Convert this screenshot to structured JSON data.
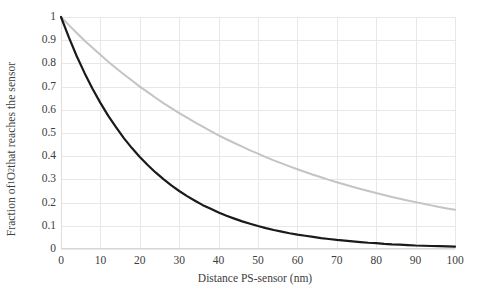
{
  "chart_data": {
    "type": "line",
    "title": "",
    "xlabel": "Distance PS-sensor (nm)",
    "ylabel_parts": {
      "pre": "Fraction of ",
      "sup": "1",
      "mid": "O",
      "sub": "2",
      "post": " that reaches the sensor"
    },
    "ylabel_plain": "Fraction of 1O2 that reaches the sensor",
    "xlim": [
      0,
      100
    ],
    "ylim": [
      0,
      1
    ],
    "xticks": [
      0,
      10,
      20,
      30,
      40,
      50,
      60,
      70,
      80,
      90,
      100
    ],
    "xtick_labels": [
      "0",
      "10",
      "20",
      "30",
      "40",
      "50",
      "60",
      "70",
      "80",
      "90",
      "100"
    ],
    "yticks": [
      0,
      0.1,
      0.2,
      0.3,
      0.4,
      0.5,
      0.6,
      0.7,
      0.8,
      0.9,
      1
    ],
    "ytick_labels": [
      "0",
      "0.1",
      "0.2",
      "0.3",
      "0.4",
      "0.5",
      "0.6",
      "0.7",
      "0.8",
      "0.9",
      "1"
    ],
    "grid": true,
    "grid_color": "#e8e8e8",
    "legend": null,
    "background": "#ffffff",
    "x": [
      0,
      2,
      4,
      6,
      8,
      10,
      12,
      14,
      16,
      18,
      20,
      22,
      24,
      26,
      28,
      30,
      32,
      34,
      36,
      38,
      40,
      42,
      44,
      46,
      48,
      50,
      52,
      54,
      56,
      58,
      60,
      62,
      64,
      66,
      68,
      70,
      72,
      74,
      76,
      78,
      80,
      82,
      84,
      86,
      88,
      90,
      92,
      94,
      96,
      98,
      100
    ],
    "series": [
      {
        "name": "slow-decay-curve",
        "color": "#c4c4c4",
        "width": 2.0,
        "decay_length_nm": 56.5,
        "values": [
          1,
          0.965,
          0.931,
          0.898,
          0.867,
          0.837,
          0.807,
          0.779,
          0.752,
          0.726,
          0.7,
          0.676,
          0.652,
          0.629,
          0.607,
          0.586,
          0.566,
          0.546,
          0.527,
          0.508,
          0.49,
          0.473,
          0.457,
          0.441,
          0.425,
          0.411,
          0.396,
          0.382,
          0.369,
          0.356,
          0.344,
          0.332,
          0.32,
          0.309,
          0.298,
          0.288,
          0.278,
          0.268,
          0.259,
          0.25,
          0.241,
          0.233,
          0.224,
          0.217,
          0.209,
          0.202,
          0.195,
          0.188,
          0.181,
          0.175,
          0.169
        ]
      },
      {
        "name": "fast-decay-curve",
        "color": "#1a1a1a",
        "width": 2.2,
        "decay_length_nm": 21.7,
        "values": [
          1,
          0.912,
          0.831,
          0.758,
          0.691,
          0.63,
          0.574,
          0.524,
          0.477,
          0.435,
          0.397,
          0.362,
          0.33,
          0.301,
          0.274,
          0.25,
          0.228,
          0.208,
          0.189,
          0.173,
          0.157,
          0.143,
          0.131,
          0.119,
          0.109,
          0.099,
          0.09,
          0.082,
          0.075,
          0.068,
          0.062,
          0.057,
          0.052,
          0.047,
          0.043,
          0.039,
          0.036,
          0.033,
          0.03,
          0.027,
          0.025,
          0.022,
          0.02,
          0.019,
          0.017,
          0.015,
          0.014,
          0.013,
          0.012,
          0.011,
          0.01
        ]
      }
    ]
  }
}
